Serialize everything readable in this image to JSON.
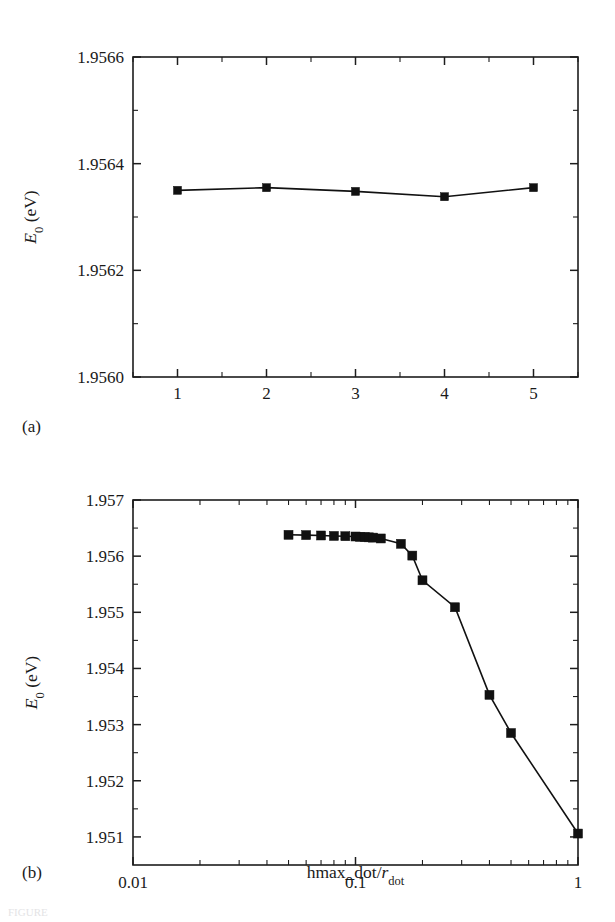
{
  "figure": {
    "background": "#ffffff",
    "ink_color": "#111111",
    "caption_fragment": "FIGURE"
  },
  "panels": [
    {
      "id": "a",
      "label": "(a)",
      "xlabel": "hmax_ox (nm)",
      "ylabel_main": "E",
      "ylabel_sub": "0",
      "ylabel_unit": " (eV)"
    },
    {
      "id": "b",
      "label": "(b)",
      "xlabel_main": "hmax_dot/",
      "xlabel_italic": "r",
      "xlabel_sub": "dot",
      "ylabel_main": "E",
      "ylabel_sub": "0",
      "ylabel_unit": " (eV)"
    }
  ],
  "chart_data": [
    {
      "type": "line",
      "panel": "a",
      "title": "",
      "xlabel": "hmax_ox (nm)",
      "ylabel": "E_0 (eV)",
      "xscale": "linear",
      "yscale": "linear",
      "xlim": [
        0.5,
        5.5
      ],
      "ylim": [
        1.956,
        1.9566
      ],
      "x_major_ticks": [
        1,
        2,
        3,
        4,
        5
      ],
      "x_major_labels": [
        "1",
        "2",
        "3",
        "4",
        "5"
      ],
      "x_minor_ticks": [
        0.5,
        1.5,
        2.5,
        3.5,
        4.5,
        5.5
      ],
      "y_major_ticks": [
        1.956,
        1.9562,
        1.9564,
        1.9566
      ],
      "y_major_labels": [
        "1.9560",
        "1.9562",
        "1.9564",
        "1.9566"
      ],
      "y_minor_ticks": [
        1.9561,
        1.9563,
        1.9565
      ],
      "grid": false,
      "legend": false,
      "marker": "square",
      "x": [
        1,
        2,
        3,
        4,
        5
      ],
      "values": [
        1.95635,
        1.956355,
        1.956348,
        1.956338,
        1.956355
      ]
    },
    {
      "type": "line",
      "panel": "b",
      "title": "",
      "xlabel": "hmax_dot/r_dot",
      "ylabel": "E_0 (eV)",
      "xscale": "log",
      "yscale": "linear",
      "xlim": [
        0.01,
        1
      ],
      "ylim": [
        1.9505,
        1.957
      ],
      "x_major_ticks": [
        0.01,
        0.1,
        1
      ],
      "x_major_labels": [
        "0.01",
        "0.1",
        "1"
      ],
      "x_minor_ticks": [
        0.02,
        0.03,
        0.04,
        0.05,
        0.06,
        0.07,
        0.08,
        0.09,
        0.2,
        0.3,
        0.4,
        0.5,
        0.6,
        0.7,
        0.8,
        0.9
      ],
      "y_major_ticks": [
        1.951,
        1.952,
        1.953,
        1.954,
        1.955,
        1.956,
        1.957
      ],
      "y_major_labels": [
        "1.951",
        "1.952",
        "1.953",
        "1.954",
        "1.955",
        "1.956",
        "1.957"
      ],
      "y_minor_ticks": [
        1.9515,
        1.9525,
        1.9535,
        1.9545,
        1.9555,
        1.9565
      ],
      "grid": false,
      "legend": false,
      "marker": "square",
      "x": [
        0.05,
        0.06,
        0.07,
        0.08,
        0.09,
        0.1,
        0.105,
        0.11,
        0.115,
        0.12,
        0.13,
        0.16,
        0.18,
        0.2,
        0.28,
        0.4,
        0.5,
        1.0
      ],
      "values": [
        1.95638,
        1.956375,
        1.956368,
        1.95636,
        1.956355,
        1.95635,
        1.956345,
        1.95634,
        1.956335,
        1.95633,
        1.956315,
        1.95622,
        1.95601,
        1.95557,
        1.95509,
        1.95353,
        1.95285,
        1.95106
      ]
    }
  ]
}
